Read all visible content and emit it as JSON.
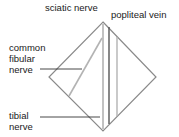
{
  "diagram": {
    "labels": {
      "sciatic_nerve": "sciatic nerve",
      "popliteal_vein": "popliteal vein",
      "common_fibular_nerve": "common\nfibular\nnerve",
      "tibial_nerve": "tibial\nnerve"
    },
    "colors": {
      "outline": "#8a8a8a",
      "nerve": "#b3b3b3",
      "vein": "#555555",
      "leader": "#333333",
      "text": "#1a1a1a"
    }
  }
}
